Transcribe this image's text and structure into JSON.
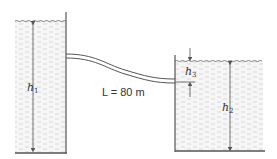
{
  "diagram": {
    "type": "two-reservoir pipe system",
    "labels": {
      "h1": {
        "main": "h",
        "sub": "1"
      },
      "h2": {
        "main": "h",
        "sub": "2"
      },
      "h3": {
        "main": "h",
        "sub": "3"
      },
      "pipe_length": "L = 80 m"
    },
    "colors": {
      "line": "#555555",
      "water_fill": "#f4f4f4",
      "water_texture": "#c8c8c8",
      "text": "#333333"
    }
  }
}
